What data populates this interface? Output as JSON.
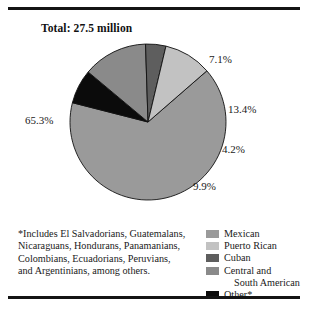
{
  "chart_title": "Total: 27.5 million",
  "footnote": {
    "lines": [
      "*Includes El Salvadorians, Guatemalans,",
      "Nicaraguans, Hondurans, Panamanians,",
      "Colombians, Ecuadorians, Peruvians,",
      "and Argentinians, among others."
    ]
  },
  "legend": {
    "items": [
      {
        "label": "Mexican",
        "color": "#9a9a9a"
      },
      {
        "label": "Puerto Rican",
        "color": "#c2c2c2"
      },
      {
        "label": "Cuban",
        "color": "#5e5e5e"
      },
      {
        "label": "Central and",
        "label2": "South American",
        "color": "#8a8a8a"
      },
      {
        "label": "Other*",
        "color": "#0b0b0b"
      }
    ]
  },
  "labels": {
    "mexican": "65.3%",
    "other": "7.1%",
    "central": "13.4%",
    "cuban": "4.2%",
    "puerto_rican": "9.9%"
  },
  "chart_data": {
    "type": "pie",
    "title": "Total: 27.5 million",
    "total": "27.5 million",
    "unit": "percent",
    "categories": [
      "Mexican",
      "Other*",
      "Central and South American",
      "Cuban",
      "Puerto Rican"
    ],
    "values": [
      65.3,
      7.1,
      13.4,
      4.2,
      9.9
    ],
    "labels": [
      "65.3%",
      "7.1%",
      "13.4%",
      "4.2%",
      "9.9%"
    ],
    "colors": [
      "#9a9a9a",
      "#0b0b0b",
      "#8a8a8a",
      "#5e5e5e",
      "#c2c2c2"
    ],
    "start_angle_deg": -41,
    "direction": "clockwise",
    "legend_position": "bottom-right",
    "grid": false,
    "xlabel": "",
    "ylabel": "",
    "annotations": [
      "*Includes El Salvadorians, Guatemalans, Nicaraguans, Hondurans, Panamanians, Colombians, Ecuadorians, Peruvians, and Argentinians, among others."
    ]
  },
  "geometry": {
    "cx": 148,
    "cy": 122,
    "r": 78
  }
}
